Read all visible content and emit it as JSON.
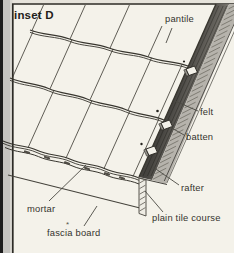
{
  "title": "inset D",
  "labels": {
    "pantile": "pantile",
    "felt": "felt",
    "batten": "batten",
    "rafter": "rafter",
    "plain_tile_course": "plain tile course",
    "mortar": "mortar",
    "fascia_board": "fascia board",
    "footnote_marker": "*"
  },
  "colors": {
    "page_background": "#e6e3db",
    "panel_background": "#f4f2ea",
    "page_edge_black": "#1c1c1c",
    "page_edge_gray": "#c4c3bf",
    "line_ink": "#38362f",
    "felt_dark": "#45433f",
    "felt_light": "#96938c",
    "rafter_face": "#b6b3ac",
    "batten_face": "#f2f0e8"
  }
}
